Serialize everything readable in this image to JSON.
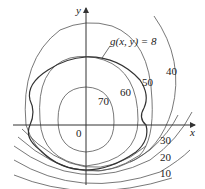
{
  "figure": {
    "type": "contour_plot",
    "axes": {
      "x_label": "x",
      "y_label": "y",
      "origin_label": "0"
    },
    "constraint_label": "g(x, y) = 8",
    "contour_labels": [
      {
        "value": "70"
      },
      {
        "value": "60"
      },
      {
        "value": "50"
      },
      {
        "value": "40"
      },
      {
        "value": "30"
      },
      {
        "value": "20"
      },
      {
        "value": "10"
      }
    ],
    "colors": {
      "background": "#ffffff",
      "lines": "#555555",
      "constraint": "#333333",
      "text": "#222222"
    }
  }
}
